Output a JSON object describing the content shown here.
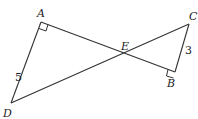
{
  "diagram": {
    "points": {
      "A": {
        "label": "A",
        "x": 41,
        "y": 22
      },
      "B": {
        "label": "B",
        "x": 175,
        "y": 72
      },
      "C": {
        "label": "C",
        "x": 189,
        "y": 24
      },
      "D": {
        "label": "D",
        "x": 11,
        "y": 103
      },
      "E": {
        "label": "E",
        "x": 124,
        "y": 56
      }
    },
    "segments": [
      "AB",
      "DC",
      "AD",
      "CB"
    ],
    "right_angles": [
      "A",
      "B"
    ],
    "lengths": {
      "AD": "5",
      "CB": "3"
    },
    "stroke_color": "#333333"
  }
}
